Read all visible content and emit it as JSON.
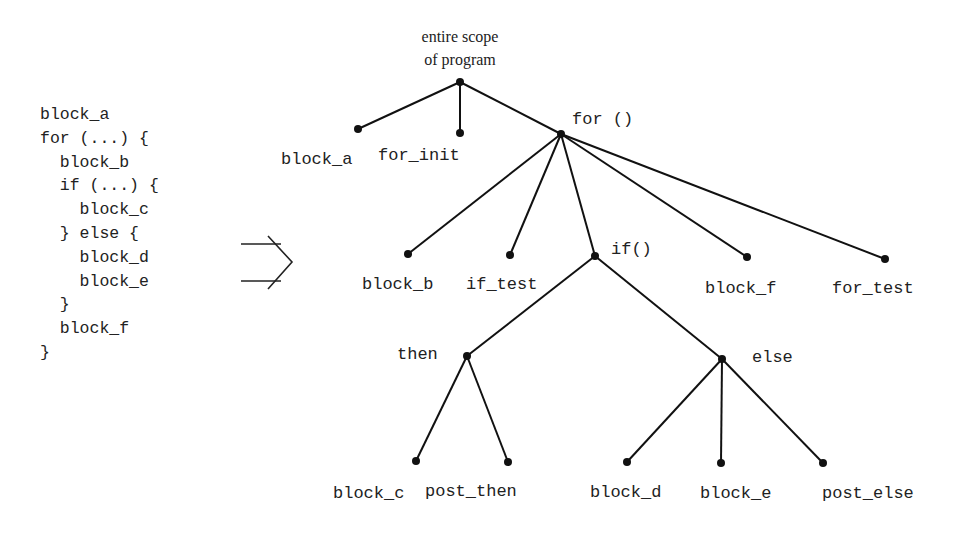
{
  "code": {
    "lines": [
      "block_a",
      "for (...) {",
      "  block_b",
      "  if (...) {",
      "    block_c",
      "  } else {",
      "    block_d",
      "    block_e",
      "  }",
      "  block_f",
      "}"
    ]
  },
  "arrow": {
    "icon": "implies-arrow-icon"
  },
  "tree": {
    "root_label_line1": "entire scope",
    "root_label_line2": "of program",
    "nodes": {
      "block_a": "block_a",
      "for_init": "for_init",
      "for": "for ()",
      "block_b": "block_b",
      "if_test": "if_test",
      "if": "if()",
      "block_f": "block_f",
      "for_test": "for_test",
      "then": "then",
      "else": "else",
      "block_c": "block_c",
      "post_then": "post_then",
      "block_d": "block_d",
      "block_e": "block_e",
      "post_else": "post_else"
    }
  }
}
